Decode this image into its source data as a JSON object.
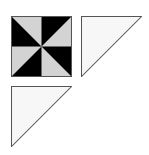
{
  "diagram": {
    "colors": {
      "dark": "#000000",
      "light": "#d3d3d3",
      "triangle_fill": "#f7f7f7",
      "outline": "#555555",
      "background": "#ffffff"
    },
    "pieces": [
      {
        "id": "pinwheel-square",
        "type": "square",
        "x": 11,
        "y": 16,
        "size": 61,
        "segments": 8
      },
      {
        "id": "right-triangle",
        "type": "half-square-triangle",
        "x": 81,
        "y": 16,
        "size": 61,
        "right_angle": "top-left"
      },
      {
        "id": "bottom-triangle",
        "type": "half-square-triangle",
        "x": 11,
        "y": 86,
        "size": 61,
        "right_angle": "top-left"
      }
    ]
  }
}
